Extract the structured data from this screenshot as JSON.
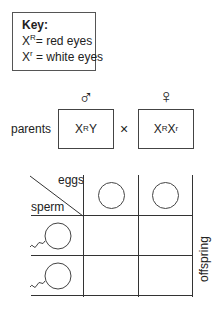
{
  "key": {
    "title": "Key:",
    "items": [
      {
        "allele_base": "X",
        "allele_sup": "R",
        "text": "= red eyes"
      },
      {
        "allele_base": "X",
        "allele_sup": "r",
        "text": " = white eyes"
      }
    ]
  },
  "parents": {
    "label": "parents",
    "male": {
      "symbol": "♂",
      "genotype_parts": [
        "X",
        "R",
        "Y",
        ""
      ]
    },
    "cross_symbol": "×",
    "female": {
      "symbol": "♀",
      "genotype_parts": [
        "X",
        "R",
        "X",
        "r"
      ]
    }
  },
  "punnett": {
    "header_eggs": "eggs",
    "header_sperm": "sperm",
    "side_label": "offspring",
    "egg_cells": 2,
    "sperm_cells": 2
  }
}
